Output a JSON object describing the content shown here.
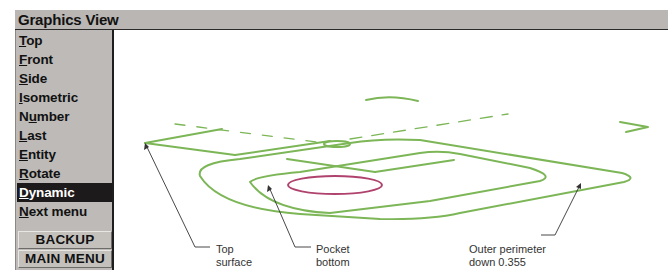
{
  "window": {
    "title": "Graphics View"
  },
  "menu": {
    "items": [
      {
        "mnemonic": "T",
        "rest": "op",
        "selected": false
      },
      {
        "mnemonic": "F",
        "rest": "ront",
        "selected": false
      },
      {
        "mnemonic": "S",
        "rest": "ide",
        "selected": false
      },
      {
        "mnemonic": "I",
        "rest": "sometric",
        "selected": false
      },
      {
        "pre": "N",
        "mnemonic": "u",
        "rest": "mber",
        "selected": false
      },
      {
        "mnemonic": "L",
        "rest": "ast",
        "selected": false
      },
      {
        "mnemonic": "E",
        "rest": "ntity",
        "selected": false
      },
      {
        "mnemonic": "R",
        "rest": "otate",
        "selected": false
      },
      {
        "mnemonic": "D",
        "rest": "ynamic",
        "selected": true
      },
      {
        "mnemonic": "N",
        "rest": "ext menu",
        "selected": false
      }
    ],
    "backup_label": "BACKUP",
    "main_menu_label": "MAIN MENU"
  },
  "callouts": {
    "top_surface": {
      "line1": "Top",
      "line2": "surface"
    },
    "pocket_bottom": {
      "line1": "Pocket",
      "line2": "bottom"
    },
    "outer_perimeter": {
      "line1": "Outer perimeter",
      "line2": "down 0.355"
    }
  },
  "colors": {
    "geometry_green": "#7cb657",
    "pocket_magenta": "#b0436e",
    "selected_bg": "#1d1a1c",
    "panel_gray": "#bdbab7"
  }
}
